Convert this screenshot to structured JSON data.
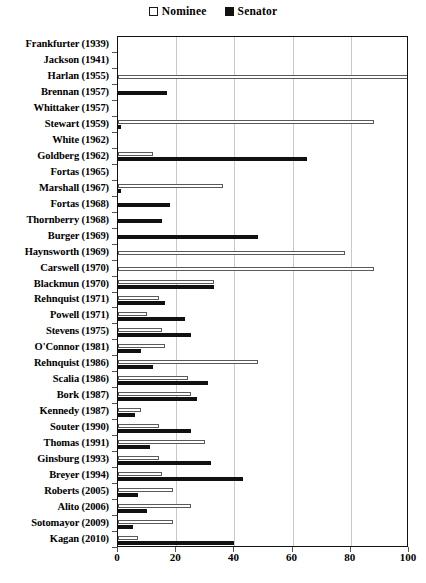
{
  "chart_data": {
    "type": "bar",
    "orientation": "horizontal",
    "title": "",
    "xlabel": "",
    "ylabel": "",
    "xlim": [
      0,
      100
    ],
    "xticks": [
      0,
      20,
      40,
      60,
      80,
      100
    ],
    "grid": true,
    "legend_position": "top-center",
    "legend": [
      "Nominee",
      "Senator"
    ],
    "categories": [
      "Frankfurter (1939)",
      "Jackson (1941)",
      "Harlan (1955)",
      "Brennan (1957)",
      "Whittaker (1957)",
      "Stewart (1959)",
      "White (1962)",
      "Goldberg (1962)",
      "Fortas (1965)",
      "Marshall (1967)",
      "Fortas (1968)",
      "Thornberry (1968)",
      "Burger (1969)",
      "Haynsworth (1969)",
      "Carswell (1970)",
      "Blackmun (1970)",
      "Rehnquist (1971)",
      "Powell (1971)",
      "Stevens (1975)",
      "O'Connor (1981)",
      "Rehnquist (1986)",
      "Scalia (1986)",
      "Bork (1987)",
      "Kennedy (1987)",
      "Souter (1990)",
      "Thomas (1991)",
      "Ginsburg (1993)",
      "Breyer (1994)",
      "Roberts (2005)",
      "Alito (2006)",
      "Sotomayor (2009)",
      "Kagan (2010)"
    ],
    "series": [
      {
        "name": "Nominee",
        "color": "#ffffff",
        "edgecolor": "#5a5a5a",
        "values": [
          0,
          0,
          100,
          0,
          0,
          88,
          0,
          12,
          0,
          36,
          0,
          0,
          0,
          78,
          88,
          33,
          14,
          10,
          15,
          16,
          48,
          24,
          25,
          8,
          14,
          30,
          14,
          15,
          19,
          25,
          19,
          7
        ]
      },
      {
        "name": "Senator",
        "color": "#111111",
        "edgecolor": "#111111",
        "values": [
          0,
          0,
          0,
          17,
          0,
          1,
          0,
          65,
          0,
          1,
          18,
          15,
          48,
          0,
          0,
          33,
          16,
          23,
          25,
          8,
          12,
          31,
          27,
          6,
          25,
          11,
          32,
          43,
          7,
          10,
          5,
          40
        ]
      }
    ]
  }
}
